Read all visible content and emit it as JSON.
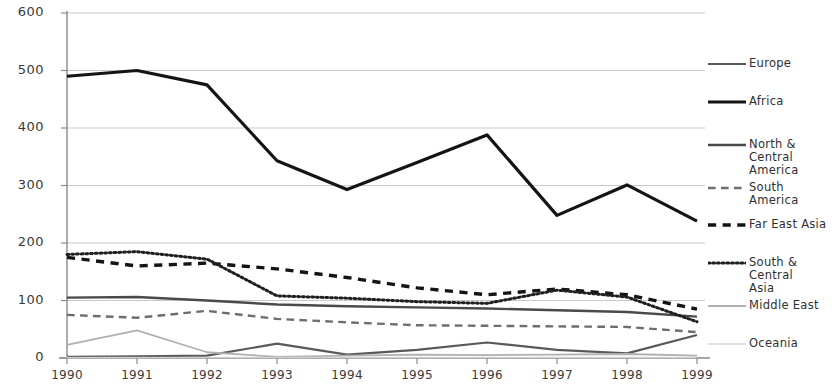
{
  "chart_data": {
    "type": "line",
    "title": "",
    "subtitle": "",
    "xlabel": "",
    "ylabel": "",
    "x": [
      1990,
      1991,
      1992,
      1993,
      1994,
      1995,
      1996,
      1997,
      1998,
      1999
    ],
    "categories": [
      "1990",
      "1991",
      "1992",
      "1993",
      "1994",
      "1995",
      "1996",
      "1997",
      "1998",
      "1999"
    ],
    "ylim": [
      0,
      600
    ],
    "xlim": [
      1990,
      1999
    ],
    "yticks": [
      0,
      100,
      200,
      300,
      400,
      500,
      600
    ],
    "ytick_labels": [
      "0",
      "100",
      "200",
      "300",
      "400",
      "500",
      "600"
    ],
    "grid": true,
    "grid_axis": "y",
    "legend_position": "right",
    "series": [
      {
        "name": "Europe",
        "values": [
          2,
          3,
          4,
          25,
          6,
          14,
          27,
          14,
          8,
          40
        ],
        "color": "#595959",
        "style": "solid",
        "width": 2.2
      },
      {
        "name": "Africa",
        "values": [
          490,
          500,
          475,
          343,
          293,
          340,
          388,
          248,
          301,
          238
        ],
        "color": "#141414",
        "style": "solid",
        "width": 3.2
      },
      {
        "name": "North & Central America",
        "values": [
          105,
          106,
          100,
          93,
          90,
          88,
          86,
          83,
          80,
          72
        ],
        "color": "#4a4a4a",
        "style": "solid",
        "width": 2.4
      },
      {
        "name": "South America",
        "values": [
          75,
          70,
          82,
          68,
          62,
          57,
          56,
          55,
          54,
          45
        ],
        "color": "#6e6e6e",
        "style": "dashed",
        "width": 2.4
      },
      {
        "name": "Far East Asia",
        "values": [
          175,
          160,
          165,
          155,
          140,
          122,
          110,
          120,
          110,
          85
        ],
        "color": "#141414",
        "style": "dashed-bold",
        "width": 3.4
      },
      {
        "name": "South & Central Asia",
        "values": [
          180,
          185,
          172,
          108,
          104,
          98,
          95,
          118,
          106,
          63
        ],
        "color": "#1f1f1f",
        "style": "dotted",
        "width": 3.0
      },
      {
        "name": "Middle East",
        "values": [
          23,
          48,
          10,
          2,
          4,
          6,
          5,
          6,
          7,
          4
        ],
        "color": "#b0b0b0",
        "style": "solid",
        "width": 1.8
      },
      {
        "name": "Oceania",
        "values": [
          1,
          1,
          1,
          1,
          1,
          1,
          1,
          1,
          1,
          1
        ],
        "color": "#d2d2d2",
        "style": "dotted",
        "width": 1.6
      }
    ]
  },
  "axes": {
    "y_tick_labels": [
      "600",
      "500",
      "400",
      "300",
      "200",
      "100",
      "0"
    ],
    "x_tick_labels": [
      "1990",
      "1991",
      "1992",
      "1993",
      "1994",
      "1995",
      "1996",
      "1997",
      "1998",
      "1999"
    ]
  },
  "legend": {
    "items": [
      {
        "label": "Europe"
      },
      {
        "label": "Africa"
      },
      {
        "label": "North & Central\nAmerica"
      },
      {
        "label": "South America"
      },
      {
        "label": "Far East Asia"
      },
      {
        "label": "South & Central\nAsia"
      },
      {
        "label": "Middle East"
      },
      {
        "label": "Oceania"
      }
    ]
  },
  "colors": {
    "axis": "#8a8a8a",
    "grid": "#c9c9c9",
    "text": "#3a3a3a",
    "background": "#ffffff"
  }
}
